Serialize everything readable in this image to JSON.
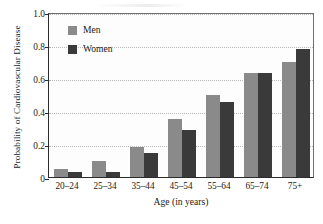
{
  "chart_data": {
    "type": "bar",
    "title": "",
    "subtitle": "",
    "xlabel": "Age (in years)",
    "ylabel": "Probability of Cardiovascular Disease",
    "categories": [
      "20–24",
      "25–34",
      "35–44",
      "45–54",
      "55–64",
      "65–74",
      "75+"
    ],
    "series": [
      {
        "name": "Men",
        "color": "#8a8a8a",
        "values": [
          0.05,
          0.1,
          0.18,
          0.35,
          0.5,
          0.63,
          0.695
        ]
      },
      {
        "name": "Women",
        "color": "#3a3a3a",
        "values": [
          0.03,
          0.03,
          0.145,
          0.285,
          0.455,
          0.63,
          0.775
        ]
      }
    ],
    "ylim": [
      0,
      1.0
    ],
    "yticks": [
      0,
      0.2,
      0.4,
      0.6,
      0.8,
      1.0
    ],
    "ytick_labels": [
      "0",
      "0.2",
      "0.4",
      "0.6",
      "0.8",
      "1.0"
    ],
    "grid": true,
    "grid_axis": "y",
    "legend_position": "upper-left-inside"
  },
  "legend": {
    "entries": [
      {
        "label": "Men",
        "color": "#8a8a8a"
      },
      {
        "label": "Women",
        "color": "#3a3a3a"
      }
    ]
  },
  "axes": {
    "y_title": "Probability of Cardiovascular Disease",
    "x_title": "Age (in years)"
  }
}
